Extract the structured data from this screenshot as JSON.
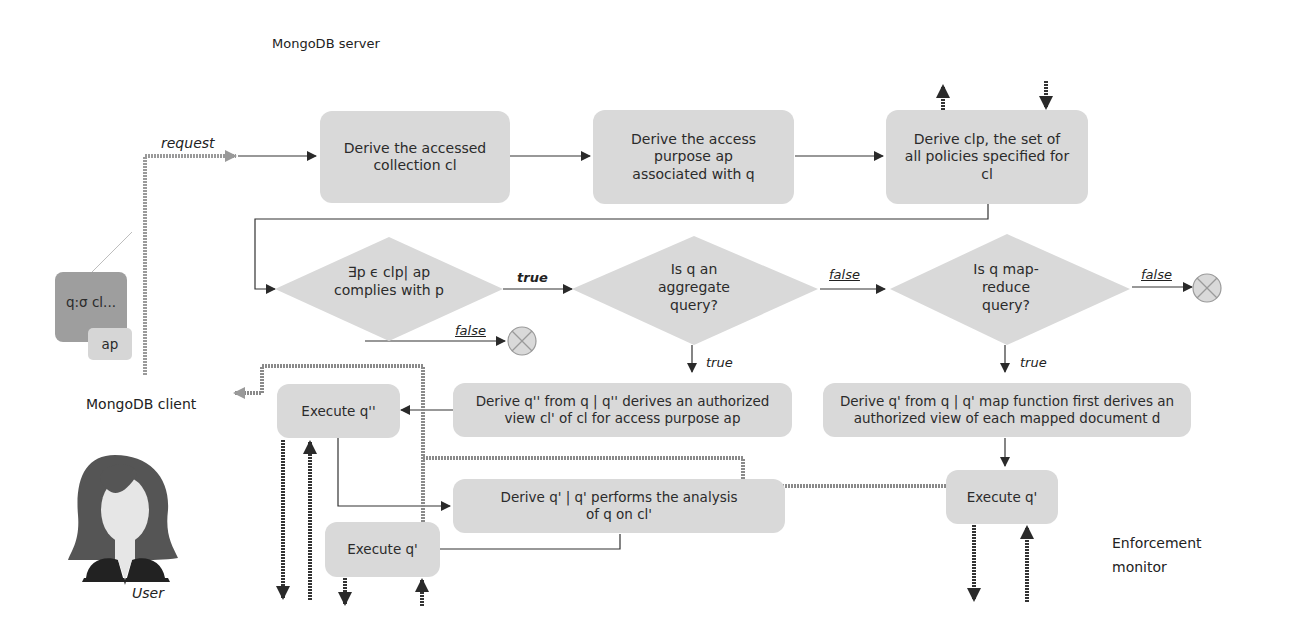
{
  "labels": {
    "server": "MongoDB  server",
    "client": "MongoDB client",
    "user": "User",
    "monitor_line1": "Enforcement",
    "monitor_line2": "monitor",
    "request": "request"
  },
  "client_query": {
    "query": "q:σ cl...",
    "purpose": "ap"
  },
  "nodes": {
    "derive_collection": "Derive the accessed collection cl",
    "derive_purpose": "Derive the access purpose ap associated with q",
    "derive_clp": "Derive clp, the set of all policies specified for cl",
    "decision_comply": "∃p ϵ clp| ap complies with p",
    "decision_aggregate": "Is q an aggregate query?",
    "decision_mapreduce": "Is q map-reduce query?",
    "derive_q2": "Derive q'' from q | q'' derives an authorized view cl' of cl for access purpose ap",
    "derive_q1_map": "Derive q' from q | q' map function first derives an authorized view of each mapped document d",
    "execute_q2": "Execute q''",
    "derive_q1_analysis": "Derive q' | q' performs the analysis of q on cl'",
    "execute_q1_left": "Execute q'",
    "execute_q1_right": "Execute q'"
  },
  "edges": {
    "comply_true": "true",
    "comply_false": "false",
    "aggregate_false": "false",
    "aggregate_true": "true",
    "mapreduce_false": "false",
    "mapreduce_true": "true"
  },
  "colors": {
    "box_fill": "#d9d9d9",
    "client_query_fill": "#9e9e9e",
    "client_purpose_fill": "#d6d6d6",
    "arrow": "#333333",
    "dotted_path": "#8a8a8a",
    "reject_fill": "#d9d9d9"
  }
}
